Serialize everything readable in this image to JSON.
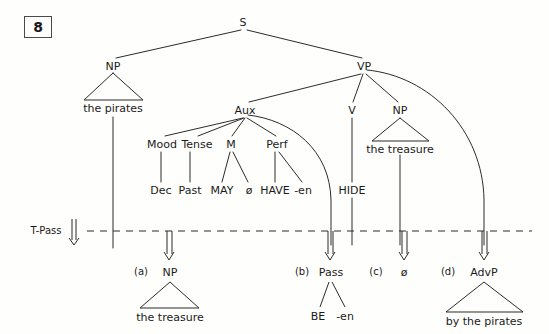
{
  "figure": {
    "number": "8",
    "caption_label": "figure-number-box"
  },
  "colors": {
    "ink": "#1a1a1a",
    "line": "#2b2b2b",
    "background": "#fefefc",
    "box_border": "#4a4a4a"
  },
  "transformation": {
    "label": "T-Pass",
    "arrow_icon": "hollow-down-arrow-icon",
    "divider_style": "dashed"
  },
  "tree": {
    "root": {
      "label": "S",
      "x": 243,
      "y": 22
    },
    "nodes": [
      {
        "name": "s",
        "label": "S",
        "x": 243,
        "y": 22,
        "kind": "node"
      },
      {
        "name": "np-subject",
        "label": "NP",
        "x": 113,
        "y": 66,
        "kind": "node"
      },
      {
        "name": "vp",
        "label": "VP",
        "x": 364,
        "y": 66,
        "kind": "node"
      },
      {
        "name": "aux",
        "label": "Aux",
        "x": 245,
        "y": 110,
        "kind": "node"
      },
      {
        "name": "v",
        "label": "V",
        "x": 352,
        "y": 110,
        "kind": "node"
      },
      {
        "name": "np-object",
        "label": "NP",
        "x": 400,
        "y": 110,
        "kind": "node"
      },
      {
        "name": "mood",
        "label": "Mood",
        "x": 162,
        "y": 144,
        "kind": "node"
      },
      {
        "name": "tense",
        "label": "Tense",
        "x": 196,
        "y": 144,
        "kind": "node"
      },
      {
        "name": "m",
        "label": "M",
        "x": 231,
        "y": 144,
        "kind": "node"
      },
      {
        "name": "perf",
        "label": "Perf",
        "x": 277,
        "y": 144,
        "kind": "node"
      }
    ],
    "terminals": [
      {
        "name": "the-pirates-subject",
        "label": "the pirates",
        "x": 113,
        "y": 110,
        "triangle": true
      },
      {
        "name": "the-treasure-object",
        "label": "the treasure",
        "x": 400,
        "y": 148,
        "triangle": true
      },
      {
        "name": "dec",
        "label": "Dec",
        "x": 161,
        "y": 190,
        "triangle": false
      },
      {
        "name": "past",
        "label": "Past",
        "x": 190,
        "y": 190,
        "triangle": false
      },
      {
        "name": "may",
        "label": "MAY",
        "x": 222,
        "y": 190,
        "triangle": false
      },
      {
        "name": "m-zero",
        "label": "ø",
        "x": 249,
        "y": 190,
        "triangle": false
      },
      {
        "name": "have",
        "label": "HAVE",
        "x": 274,
        "y": 190,
        "triangle": false
      },
      {
        "name": "en",
        "label": "-en",
        "x": 303,
        "y": 190,
        "triangle": false
      },
      {
        "name": "hide",
        "label": "HIDE",
        "x": 352,
        "y": 190,
        "triangle": false
      }
    ],
    "edges": [
      {
        "from": "s",
        "to": "np-subject"
      },
      {
        "from": "s",
        "to": "vp"
      },
      {
        "from": "vp",
        "to": "aux"
      },
      {
        "from": "vp",
        "to": "v"
      },
      {
        "from": "vp",
        "to": "np-object"
      },
      {
        "from": "aux",
        "to": "mood"
      },
      {
        "from": "aux",
        "to": "tense"
      },
      {
        "from": "aux",
        "to": "m"
      },
      {
        "from": "aux",
        "to": "perf"
      },
      {
        "from": "mood",
        "to": "dec"
      },
      {
        "from": "tense",
        "to": "past"
      },
      {
        "from": "m",
        "to": "may"
      },
      {
        "from": "m",
        "to": "m-zero"
      },
      {
        "from": "perf",
        "to": "have"
      },
      {
        "from": "perf",
        "to": "en"
      },
      {
        "from": "v",
        "to": "hide"
      }
    ]
  },
  "output": {
    "items": [
      {
        "name": "output-a",
        "index": "(a)",
        "label": "NP",
        "terminal": "the treasure",
        "triangle": true,
        "x": 170,
        "source": "np-object-moved-to-subject"
      },
      {
        "name": "output-b",
        "index": "(b)",
        "label": "Pass",
        "children": [
          "BE",
          "-en"
        ],
        "triangle": false,
        "x": 330,
        "source": "aux-pass-inserted"
      },
      {
        "name": "output-c",
        "index": "(c)",
        "label": "ø",
        "children": [],
        "triangle": false,
        "x": 404,
        "source": "object-position-emptied"
      },
      {
        "name": "output-d",
        "index": "(d)",
        "label": "AdvP",
        "terminal": "by the pirates",
        "triangle": true,
        "x": 484,
        "source": "subject-demoted-to-by-phrase"
      }
    ]
  }
}
